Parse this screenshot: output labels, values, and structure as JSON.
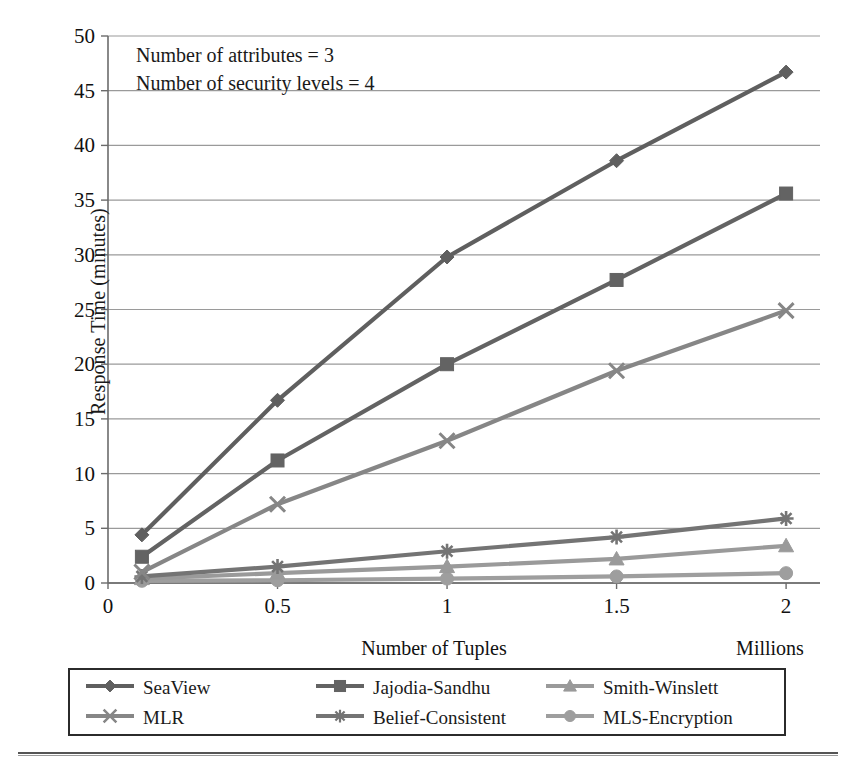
{
  "chart_data": {
    "type": "line",
    "title": "",
    "xlabel": "Number of Tuples",
    "xunit": "Millions",
    "ylabel": "Response Time (minutes)",
    "xlim": [
      0,
      2.1
    ],
    "ylim": [
      0,
      50
    ],
    "xticks": [
      "0",
      "0.5",
      "1",
      "1.5",
      "2"
    ],
    "xtickvals": [
      0,
      0.5,
      1,
      1.5,
      2
    ],
    "yticks": [
      "0",
      "5",
      "10",
      "15",
      "20",
      "25",
      "30",
      "35",
      "40",
      "45",
      "50"
    ],
    "ytickvals": [
      0,
      5,
      10,
      15,
      20,
      25,
      30,
      35,
      40,
      45,
      50
    ],
    "grid": true,
    "legend_position": "bottom",
    "x": [
      0.1,
      0.5,
      1,
      1.5,
      2
    ],
    "series": [
      {
        "name": "SeaView",
        "marker": "diamond",
        "color": "#5f5f5f",
        "values": [
          4.4,
          16.7,
          29.8,
          38.6,
          46.7
        ]
      },
      {
        "name": "Jajodia-Sandhu",
        "marker": "square",
        "color": "#636363",
        "values": [
          2.4,
          11.2,
          20.0,
          27.7,
          35.6
        ]
      },
      {
        "name": "Smith-Winslett",
        "marker": "triangle",
        "color": "#9a9a9a",
        "values": [
          0.4,
          0.9,
          1.5,
          2.2,
          3.4
        ]
      },
      {
        "name": "MLR",
        "marker": "cross",
        "color": "#868686",
        "values": [
          1.0,
          7.2,
          13.0,
          19.4,
          24.9
        ]
      },
      {
        "name": "Belief-Consistent",
        "marker": "asterisk",
        "color": "#747474",
        "values": [
          0.6,
          1.5,
          2.9,
          4.2,
          5.9
        ]
      },
      {
        "name": "MLS-Encryption",
        "marker": "circle",
        "color": "#9e9e9e",
        "values": [
          0.2,
          0.25,
          0.4,
          0.6,
          0.9
        ]
      }
    ],
    "annotations": [
      "Number of attributes = 3",
      "Number of security levels = 4"
    ]
  },
  "legend": {
    "items": [
      {
        "label": "SeaView"
      },
      {
        "label": "Jajodia-Sandhu"
      },
      {
        "label": "Smith-Winslett"
      },
      {
        "label": "MLR"
      },
      {
        "label": "Belief-Consistent"
      },
      {
        "label": "MLS-Encryption"
      }
    ]
  }
}
